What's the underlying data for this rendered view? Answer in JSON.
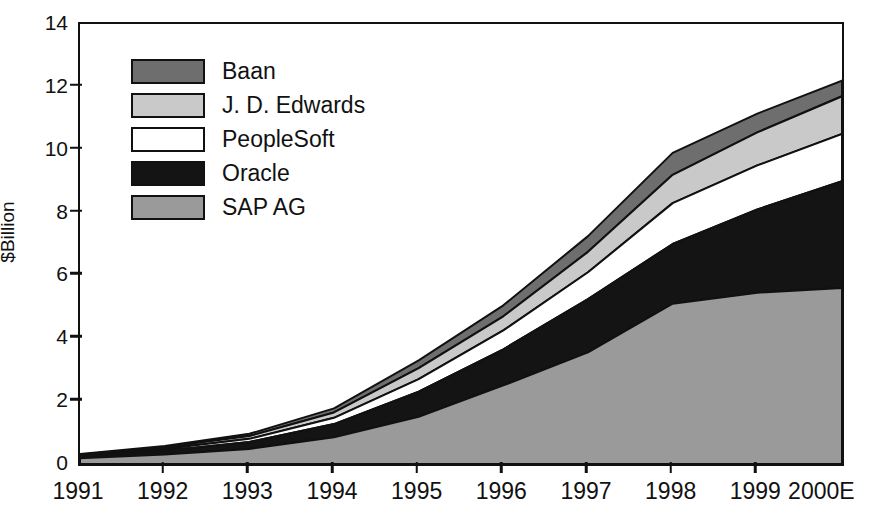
{
  "chart_data": {
    "type": "area",
    "stacked": true,
    "title": "",
    "xlabel": "",
    "ylabel": "$Billion",
    "categories": [
      "1991",
      "1992",
      "1993",
      "1994",
      "1995",
      "1996",
      "1997",
      "1998",
      "1999",
      "2000E"
    ],
    "xlim_labels": [
      "1991",
      "2000E"
    ],
    "ylim": [
      0,
      14
    ],
    "yticks": [
      0,
      2,
      4,
      6,
      8,
      10,
      12,
      14
    ],
    "ytick_labels": [
      "0",
      "2",
      "4",
      "6",
      "8",
      "10",
      "12",
      "14"
    ],
    "grid": false,
    "legend_position": "upper-left-inside",
    "stack_order_bottom_to_top": [
      "SAP AG",
      "Oracle",
      "PeopleSoft",
      "J. D. Edwards",
      "Baan"
    ],
    "series": [
      {
        "name": "SAP AG",
        "color": "#9a9a9a",
        "values": [
          0.18,
          0.3,
          0.48,
          0.85,
          1.5,
          2.5,
          3.55,
          5.1,
          5.45,
          5.6
        ]
      },
      {
        "name": "Oracle",
        "color": "#141414",
        "values": [
          0.06,
          0.12,
          0.22,
          0.42,
          0.8,
          1.15,
          1.7,
          1.9,
          2.65,
          3.4
        ]
      },
      {
        "name": "PeopleSoft",
        "color": "#ffffff",
        "values": [
          0.03,
          0.06,
          0.1,
          0.2,
          0.4,
          0.6,
          0.85,
          1.3,
          1.4,
          1.5
        ]
      },
      {
        "name": "J. D. Edwards",
        "color": "#c9c9c9",
        "values": [
          0.03,
          0.05,
          0.09,
          0.17,
          0.35,
          0.45,
          0.65,
          0.9,
          1.05,
          1.2
        ]
      },
      {
        "name": "Baan",
        "color": "#6e6e6e",
        "values": [
          0.02,
          0.04,
          0.07,
          0.13,
          0.25,
          0.35,
          0.5,
          0.7,
          0.6,
          0.5
        ]
      }
    ],
    "cumulative_tops": {
      "SAP AG": [
        0.18,
        0.3,
        0.48,
        0.85,
        1.5,
        2.5,
        3.55,
        5.1,
        5.45,
        5.6
      ],
      "Oracle": [
        0.24,
        0.42,
        0.7,
        1.27,
        2.3,
        3.65,
        5.25,
        7.0,
        8.1,
        9.0
      ],
      "PeopleSoft": [
        0.27,
        0.48,
        0.8,
        1.47,
        2.7,
        4.25,
        6.1,
        8.3,
        9.5,
        10.5
      ],
      "J. D. Edwards": [
        0.3,
        0.53,
        0.89,
        1.64,
        3.05,
        4.7,
        6.75,
        9.2,
        10.55,
        11.7
      ],
      "Baan": [
        0.32,
        0.57,
        0.96,
        1.77,
        3.3,
        5.05,
        7.25,
        9.9,
        11.15,
        12.2
      ]
    }
  },
  "axes": {
    "y_title": "$Billion",
    "y_tick_labels": [
      "14",
      "12",
      "10",
      "8",
      "6",
      "4",
      "2",
      "0"
    ],
    "x_tick_labels": [
      "1991",
      "1992",
      "1993",
      "1994",
      "1995",
      "1996",
      "1997",
      "1998",
      "1999",
      "2000E"
    ]
  },
  "legend": {
    "items": [
      {
        "label": "Baan",
        "color": "#6e6e6e",
        "swatch_name": "legend-swatch-baan"
      },
      {
        "label": "J. D. Edwards",
        "color": "#c9c9c9",
        "swatch_name": "legend-swatch-jdedwards"
      },
      {
        "label": "PeopleSoft",
        "color": "#ffffff",
        "swatch_name": "legend-swatch-peoplesoft"
      },
      {
        "label": "Oracle",
        "color": "#141414",
        "swatch_name": "legend-swatch-oracle"
      },
      {
        "label": "SAP AG",
        "color": "#9a9a9a",
        "swatch_name": "legend-swatch-sapag"
      }
    ]
  },
  "colors": {
    "axis": "#111111",
    "background": "#ffffff",
    "baan": "#6e6e6e",
    "jdedwards": "#c9c9c9",
    "peoplesoft": "#ffffff",
    "oracle": "#141414",
    "sapag": "#9a9a9a"
  }
}
